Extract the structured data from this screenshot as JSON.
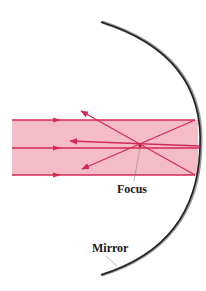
{
  "diagram": {
    "labels": {
      "focus": "Focus",
      "mirror": "Mirror"
    },
    "colors": {
      "beam_fill": "#f4bcc8",
      "ray": "#d42a55",
      "mirror": "#222222",
      "mirror_shadow": "#9a9a9a",
      "leader": "#888888",
      "label": "#1a1a1a"
    },
    "beam": {
      "x": 12,
      "y": 120,
      "width": 183,
      "height": 55
    },
    "incoming_rays_y": [
      120,
      148,
      175
    ],
    "focus_point": {
      "x": 140,
      "y": 146
    }
  }
}
